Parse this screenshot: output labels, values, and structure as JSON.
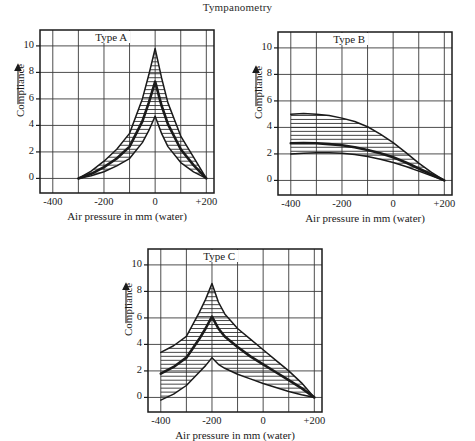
{
  "figure": {
    "title": "Tympanometry",
    "axis_titles": {
      "x": "Air pressure in mm (water)",
      "y": "Compliance"
    },
    "xticks": [
      "-400",
      "-200",
      "0",
      "+200"
    ],
    "yticks": [
      "0",
      "2",
      "4",
      "6",
      "8",
      "10"
    ],
    "colors": {
      "ink": "#1a1a1a",
      "grid": "#3a3a3a",
      "frame": "#1a1a1a",
      "hatch": "#262626",
      "background": "#ffffff"
    }
  },
  "panels": [
    {
      "id": "type-a",
      "label": "Type A",
      "x": 14,
      "y": 22,
      "w": 222,
      "h": 200,
      "plot": {
        "left": 40,
        "top": 30,
        "right": 214,
        "bottom": 193
      },
      "peak_pressure": 0
    },
    {
      "id": "type-b",
      "label": "Type B",
      "x": 252,
      "y": 22,
      "w": 222,
      "h": 200,
      "plot": {
        "left": 278,
        "top": 32,
        "right": 452,
        "bottom": 195
      },
      "peak_pressure": -400
    },
    {
      "id": "type-c",
      "label": "Type C",
      "x": 122,
      "y": 240,
      "w": 222,
      "h": 200,
      "plot": {
        "left": 148,
        "top": 249,
        "right": 322,
        "bottom": 412
      },
      "peak_pressure": -200
    }
  ],
  "chart_data": [
    {
      "type": "line",
      "id": "type-a",
      "title": "Type A",
      "xlabel": "Air pressure in mm (water)",
      "ylabel": "Compliance",
      "xlim": [
        -450,
        230
      ],
      "ylim": [
        -1.1,
        11.2
      ],
      "xticks": [
        -400,
        -200,
        0,
        200
      ],
      "xticklabels": [
        "-400",
        "-200",
        "0",
        "+200"
      ],
      "yticks": [
        0,
        2,
        4,
        6,
        8,
        10
      ],
      "grid": true,
      "legend": "none",
      "annotation": "Type A",
      "shaded_band": "between upper and lower envelope, horizontal hatching",
      "series": [
        {
          "name": "upper envelope",
          "x": [
            -300,
            -250,
            -200,
            -150,
            -100,
            -50,
            -25,
            0,
            25,
            50,
            100,
            150,
            200
          ],
          "values": [
            0.0,
            0.55,
            1.3,
            2.2,
            3.4,
            6.0,
            7.8,
            9.8,
            7.6,
            5.7,
            3.2,
            1.6,
            0.0
          ]
        },
        {
          "name": "mean (bold)",
          "x": [
            -300,
            -250,
            -200,
            -150,
            -100,
            -50,
            -25,
            0,
            25,
            50,
            100,
            150,
            200
          ],
          "values": [
            0.0,
            0.35,
            0.85,
            1.5,
            2.4,
            4.3,
            5.7,
            7.3,
            5.5,
            4.1,
            2.2,
            1.0,
            0.0
          ]
        },
        {
          "name": "lower envelope",
          "x": [
            -300,
            -250,
            -200,
            -150,
            -100,
            -50,
            -25,
            0,
            25,
            50,
            100,
            150,
            200
          ],
          "values": [
            0.0,
            0.2,
            0.5,
            0.95,
            1.5,
            2.7,
            3.6,
            4.7,
            3.4,
            2.4,
            1.2,
            0.5,
            0.0
          ]
        }
      ]
    },
    {
      "type": "line",
      "id": "type-b",
      "title": "Type B",
      "xlabel": "Air pressure in mm (water)",
      "ylabel": "Compliance",
      "xlim": [
        -450,
        230
      ],
      "ylim": [
        -1.1,
        11.2
      ],
      "xticks": [
        -400,
        -200,
        0,
        200
      ],
      "xticklabels": [
        "-400",
        "-200",
        "0",
        "+200"
      ],
      "yticks": [
        0,
        2,
        4,
        6,
        8,
        10
      ],
      "grid": true,
      "legend": "none",
      "annotation": "Type B",
      "shaded_band": "between upper and lower envelope, horizontal hatching",
      "series": [
        {
          "name": "upper envelope",
          "x": [
            -400,
            -350,
            -300,
            -250,
            -200,
            -150,
            -100,
            -50,
            0,
            50,
            100,
            150,
            200
          ],
          "values": [
            5.0,
            5.05,
            5.0,
            4.9,
            4.7,
            4.45,
            4.05,
            3.5,
            2.85,
            2.1,
            1.3,
            0.6,
            0.0
          ]
        },
        {
          "name": "mean (bold)",
          "x": [
            -400,
            -350,
            -300,
            -250,
            -200,
            -150,
            -100,
            -50,
            0,
            50,
            100,
            150,
            200
          ],
          "values": [
            2.8,
            2.82,
            2.8,
            2.74,
            2.65,
            2.5,
            2.3,
            2.05,
            1.75,
            1.35,
            0.9,
            0.45,
            0.0
          ]
        },
        {
          "name": "lower envelope",
          "x": [
            -400,
            -350,
            -300,
            -250,
            -200,
            -150,
            -100,
            -50,
            0,
            50,
            100,
            150,
            200
          ],
          "values": [
            2.0,
            2.05,
            2.08,
            2.08,
            2.05,
            1.95,
            1.8,
            1.6,
            1.35,
            1.05,
            0.7,
            0.35,
            0.0
          ]
        }
      ]
    },
    {
      "type": "line",
      "id": "type-c",
      "title": "Type C",
      "xlabel": "Air pressure in mm (water)",
      "ylabel": "Compliance",
      "xlim": [
        -450,
        230
      ],
      "ylim": [
        -1.1,
        11.2
      ],
      "xticks": [
        -400,
        -200,
        0,
        200
      ],
      "xticklabels": [
        "-400",
        "-200",
        "0",
        "+200"
      ],
      "yticks": [
        0,
        2,
        4,
        6,
        8,
        10
      ],
      "grid": true,
      "legend": "none",
      "annotation": "Type C",
      "shaded_band": "between upper and lower envelope, horizontal hatching",
      "series": [
        {
          "name": "upper envelope",
          "x": [
            -400,
            -350,
            -300,
            -250,
            -225,
            -200,
            -175,
            -150,
            -100,
            -50,
            0,
            50,
            100,
            150,
            200
          ],
          "values": [
            3.4,
            3.9,
            4.6,
            6.4,
            7.4,
            8.6,
            7.2,
            6.3,
            5.2,
            4.4,
            3.6,
            2.8,
            2.0,
            1.1,
            0.0
          ]
        },
        {
          "name": "mean (bold)",
          "x": [
            -400,
            -350,
            -300,
            -250,
            -225,
            -200,
            -175,
            -150,
            -100,
            -50,
            0,
            50,
            100,
            150,
            200
          ],
          "values": [
            1.8,
            2.3,
            3.0,
            4.4,
            5.2,
            6.1,
            5.2,
            4.6,
            3.8,
            3.1,
            2.5,
            1.9,
            1.3,
            0.7,
            0.0
          ]
        },
        {
          "name": "lower envelope",
          "x": [
            -400,
            -350,
            -300,
            -250,
            -225,
            -200,
            -175,
            -150,
            -100,
            -50,
            0,
            50,
            100,
            150,
            200
          ],
          "values": [
            -0.2,
            0.25,
            0.9,
            1.9,
            2.4,
            3.0,
            2.5,
            2.2,
            1.75,
            1.4,
            1.05,
            0.75,
            0.45,
            0.2,
            0.0
          ]
        }
      ]
    }
  ]
}
